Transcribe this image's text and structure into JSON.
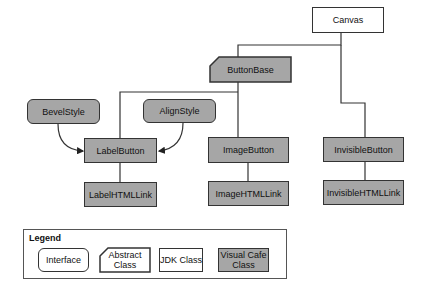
{
  "diagram": {
    "nodes": {
      "canvas": {
        "label": "Canvas",
        "kind": "JDK Class"
      },
      "button_base": {
        "label": "ButtonBase",
        "kind": "Abstract Class"
      },
      "bevel_style": {
        "label": "BevelStyle",
        "kind": "Interface"
      },
      "align_style": {
        "label": "AlignStyle",
        "kind": "Interface"
      },
      "label_button": {
        "label": "LabelButton",
        "kind": "Visual Cafe Class"
      },
      "image_button": {
        "label": "ImageButton",
        "kind": "Visual Cafe Class"
      },
      "invisible_button": {
        "label": "InvisibleButton",
        "kind": "Visual Cafe Class"
      },
      "label_html_link": {
        "label": "LabelHTMLLink",
        "kind": "Visual Cafe Class"
      },
      "image_html_link": {
        "label": "ImageHTMLLink",
        "kind": "Visual Cafe Class"
      },
      "invisible_html_link": {
        "label": "InvisibleHTMLLink",
        "kind": "Visual Cafe Class"
      }
    },
    "edges": [
      {
        "from": "Canvas",
        "to": "ButtonBase",
        "type": "inheritance"
      },
      {
        "from": "Canvas",
        "to": "InvisibleButton",
        "type": "inheritance"
      },
      {
        "from": "ButtonBase",
        "to": "LabelButton",
        "type": "inheritance"
      },
      {
        "from": "ButtonBase",
        "to": "ImageButton",
        "type": "inheritance"
      },
      {
        "from": "BevelStyle",
        "to": "LabelButton",
        "type": "uses"
      },
      {
        "from": "AlignStyle",
        "to": "LabelButton",
        "type": "uses"
      },
      {
        "from": "LabelButton",
        "to": "LabelHTMLLink",
        "type": "inheritance"
      },
      {
        "from": "ImageButton",
        "to": "ImageHTMLLink",
        "type": "inheritance"
      },
      {
        "from": "InvisibleButton",
        "to": "InvisibleHTMLLink",
        "type": "inheritance"
      }
    ]
  },
  "legend": {
    "title": "Legend",
    "items": [
      {
        "label": "Interface"
      },
      {
        "label": "Abstract Class"
      },
      {
        "label": "JDK Class"
      },
      {
        "label": "Visual Cafe Class"
      }
    ]
  },
  "colors": {
    "visual_cafe_fill": "#a6a6a6",
    "jdk_fill": "#ffffff",
    "line": "#333333"
  }
}
